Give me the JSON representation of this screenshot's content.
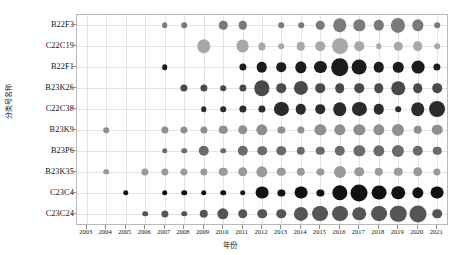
{
  "chart_data": {
    "type": "scatter",
    "subtype": "bubble-matrix",
    "title": "",
    "xlabel": "年份",
    "ylabel": "分类号名称",
    "grid": true,
    "legend": "none",
    "x_categories": [
      "2003",
      "2004",
      "2005",
      "2006",
      "2007",
      "2008",
      "2009",
      "2010",
      "2011",
      "2012",
      "2013",
      "2014",
      "2015",
      "2016",
      "2017",
      "2018",
      "2019",
      "2020",
      "2021"
    ],
    "y_categories": [
      "B22F3",
      "C22C19",
      "B22F1",
      "B23K26",
      "C22C38",
      "B23K9",
      "B23P6",
      "B23K35",
      "C23C4",
      "C23C24"
    ],
    "value_unit": "专利数量",
    "series": [
      {
        "name": "B22F3",
        "color": "#7a7a7a",
        "values": [
          0,
          0,
          0,
          0,
          1,
          1,
          0,
          3,
          3,
          0,
          1,
          1,
          3,
          9,
          6,
          5,
          10,
          6,
          1
        ]
      },
      {
        "name": "C22C19",
        "color": "#a8a8a8",
        "values": [
          0,
          0,
          0,
          0,
          0,
          0,
          9,
          0,
          8,
          2,
          1,
          3,
          4,
          13,
          4,
          1,
          3,
          4,
          1
        ]
      },
      {
        "name": "B22F1",
        "color": "#1c1c1c",
        "values": [
          0,
          0,
          0,
          0,
          1,
          0,
          0,
          0,
          2,
          5,
          4,
          6,
          7,
          16,
          11,
          5,
          5,
          8,
          2
        ]
      },
      {
        "name": "B23K26",
        "color": "#4a4a4a",
        "values": [
          0,
          0,
          0,
          0,
          0,
          2,
          2,
          1,
          2,
          12,
          4,
          10,
          4,
          4,
          4,
          4,
          9,
          4,
          4
        ]
      },
      {
        "name": "C22C38",
        "color": "#2b2b2b",
        "values": [
          0,
          0,
          0,
          0,
          0,
          0,
          1,
          1,
          2,
          2,
          10,
          5,
          4,
          9,
          10,
          5,
          1,
          9,
          13
        ]
      },
      {
        "name": "B23K9",
        "color": "#8f8f8f",
        "values": [
          0,
          1,
          0,
          0,
          2,
          2,
          2,
          3,
          4,
          6,
          2,
          2,
          6,
          6,
          6,
          6,
          7,
          3,
          5
        ]
      },
      {
        "name": "B23P6",
        "color": "#6b6b6b",
        "values": [
          0,
          0,
          0,
          0,
          1,
          1,
          5,
          1,
          5,
          4,
          4,
          3,
          3,
          5,
          6,
          6,
          7,
          5,
          3
        ]
      },
      {
        "name": "B23K35",
        "color": "#9a9a9a",
        "values": [
          0,
          1,
          0,
          2,
          2,
          2,
          2,
          3,
          4,
          6,
          3,
          3,
          2,
          7,
          4,
          3,
          3,
          4,
          2
        ]
      },
      {
        "name": "C23C4",
        "color": "#111111",
        "values": [
          0,
          0,
          1,
          0,
          1,
          1,
          1,
          1,
          1,
          8,
          2,
          8,
          2,
          12,
          15,
          11,
          9,
          6,
          8
        ]
      },
      {
        "name": "C23C24",
        "color": "#555555",
        "values": [
          0,
          0,
          0,
          1,
          2,
          1,
          3,
          6,
          4,
          4,
          4,
          10,
          13,
          13,
          9,
          13,
          14,
          15,
          4
        ]
      }
    ]
  }
}
